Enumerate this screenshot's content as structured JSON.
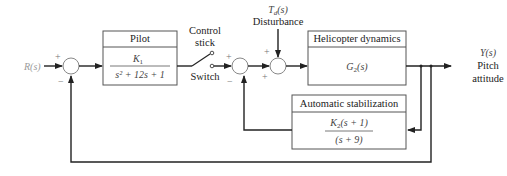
{
  "diagram": {
    "type": "block diagram",
    "input": {
      "label": "R(s)"
    },
    "output": {
      "label": "Y(s)",
      "caption_line1": "Pitch",
      "caption_line2": "attitude"
    },
    "disturbance": {
      "label": "T_d(s)",
      "label_main": "T",
      "label_sub": "d",
      "label_rest": "(s)",
      "caption": "Disturbance"
    },
    "blocks": [
      {
        "id": "pilot",
        "title": "Pilot",
        "numerator": "K",
        "numerator_sub": "1",
        "denominator": "s² + 12s + 1"
      },
      {
        "id": "helicopter",
        "title": "Helicopter dynamics",
        "transfer_main": "G",
        "transfer_sub": "2",
        "transfer_rest": "(s)"
      },
      {
        "id": "stabilization",
        "title": "Automatic stabilization",
        "numerator_main": "K",
        "numerator_sub": "2",
        "numerator_rest": "(s + 1)",
        "denominator": "(s + 9)"
      }
    ],
    "switch": {
      "label_top_line1": "Control",
      "label_top_line2": "stick",
      "label_bottom": "Switch"
    },
    "junctions": [
      {
        "id": "sum1",
        "signs": [
          "+",
          "−"
        ]
      },
      {
        "id": "sum2",
        "signs": [
          "+",
          "−"
        ]
      },
      {
        "id": "sum3",
        "signs": [
          "+",
          "+"
        ]
      }
    ],
    "colors": {
      "lines": "#222222",
      "labels_gray": "#9a9a9a"
    }
  }
}
